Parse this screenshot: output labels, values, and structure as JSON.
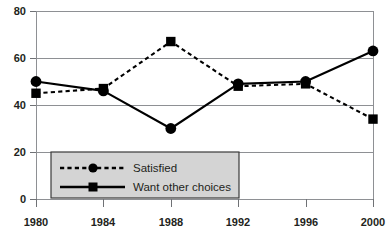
{
  "chart_data": {
    "type": "line",
    "title": "",
    "xlabel": "",
    "ylabel": "",
    "categories": [
      "1980",
      "1984",
      "1988",
      "1992",
      "1996",
      "2000"
    ],
    "x": [
      1980,
      1984,
      1988,
      1992,
      1996,
      2000
    ],
    "xlim": [
      1980,
      2000
    ],
    "ylim": [
      0,
      80
    ],
    "yticks": [
      0,
      20,
      40,
      60,
      80
    ],
    "ytick_labels": [
      "0",
      "20",
      "40",
      "60",
      "80"
    ],
    "xtick_labels": [
      "1980",
      "1984",
      "1988",
      "1992",
      "1996",
      "2000"
    ],
    "grid": true,
    "grid_axis": "y",
    "legend_position": "lower-left-inside",
    "series": [
      {
        "name": "Satisfied",
        "marker": "circle",
        "line_style": "dashed",
        "color": "#000000",
        "values": [
          50,
          46,
          30,
          49,
          50,
          63
        ]
      },
      {
        "name": "Want other choices",
        "marker": "square",
        "line_style": "solid",
        "color": "#000000",
        "values": [
          45,
          47,
          67,
          48,
          49,
          34
        ]
      }
    ]
  },
  "legend": {
    "entries": [
      {
        "label": "Satisfied"
      },
      {
        "label": "Want other choices"
      }
    ]
  },
  "colors": {
    "series_line": "#000000",
    "gridline": "#8e9094",
    "legend_fill": "#d4d4d4",
    "legend_border": "#3a3a3a",
    "text": "#231f20",
    "background": "#ffffff"
  },
  "axes": {
    "y_tick_labels": [
      "80",
      "60",
      "40",
      "20",
      "0"
    ],
    "x_tick_labels": [
      "1980",
      "1984",
      "1988",
      "1992",
      "1996",
      "2000"
    ]
  }
}
